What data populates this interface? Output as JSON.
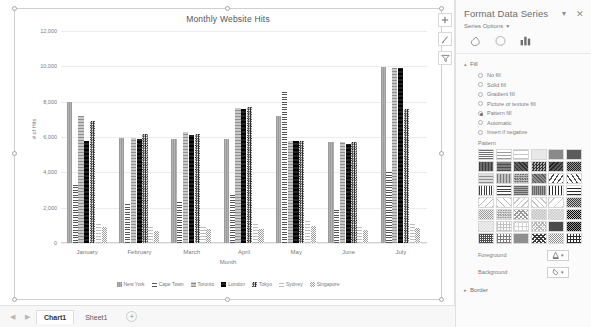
{
  "chart_data": {
    "type": "bar",
    "title": "Monthly Website Hits",
    "xlabel": "Month",
    "ylabel": "# of Hits",
    "ylim": [
      0,
      12000
    ],
    "yticks": [
      "0",
      "2,000",
      "4,000",
      "6,000",
      "8,000",
      "10,000",
      "12,000"
    ],
    "grid": true,
    "legend_position": "bottom",
    "categories": [
      "January",
      "February",
      "March",
      "April",
      "May",
      "June",
      "July"
    ],
    "series": [
      {
        "name": "New York",
        "values": [
          8000,
          5950,
          5900,
          5900,
          7200,
          5700,
          9950
        ]
      },
      {
        "name": "Cape Town",
        "values": [
          3400,
          2200,
          2400,
          2850,
          8600,
          2000,
          4100
        ]
      },
      {
        "name": "Toronto",
        "values": [
          7200,
          5950,
          6300,
          7650,
          5800,
          5700,
          9900
        ]
      },
      {
        "name": "London",
        "values": [
          5800,
          5900,
          6100,
          7600,
          5750,
          5600,
          9900
        ]
      },
      {
        "name": "Tokyo",
        "values": [
          6900,
          6150,
          6150,
          7700,
          5800,
          5700,
          7600
        ]
      },
      {
        "name": "Sydney",
        "values": [
          1200,
          900,
          1000,
          1050,
          1250,
          950,
          1100
        ]
      },
      {
        "name": "Singapore",
        "values": [
          900,
          700,
          800,
          820,
          980,
          760,
          860
        ]
      }
    ]
  },
  "chart_buttons": [
    {
      "name": "chart-elements",
      "glyph": "+"
    },
    {
      "name": "chart-styles",
      "glyph": "brush"
    },
    {
      "name": "chart-filters",
      "glyph": "funnel"
    }
  ],
  "tabbar": {
    "prev_label": "◀",
    "next_label": "▶",
    "tabs": [
      {
        "label": "Chart1",
        "active": true
      },
      {
        "label": "Sheet1",
        "active": false
      }
    ],
    "add_label": "+"
  },
  "pane": {
    "title": "Format Data Series",
    "subtitle": "Series Options",
    "subtitle_caret": "▼",
    "dropdown_glyph": "▾",
    "close_glyph": "✕",
    "tabs": [
      {
        "name": "fill-and-line-tab"
      },
      {
        "name": "effects-tab"
      },
      {
        "name": "series-options-tab"
      }
    ],
    "fill": {
      "section_label": "Fill",
      "expanded_caret": "▴",
      "options": [
        {
          "label": "No fill",
          "checked": false
        },
        {
          "label": "Solid fill",
          "checked": false
        },
        {
          "label": "Gradient fill",
          "checked": false
        },
        {
          "label": "Picture or texture fill",
          "checked": false
        },
        {
          "label": "Pattern fill",
          "checked": true
        },
        {
          "label": "Automatic",
          "checked": false
        },
        {
          "label": "Invert if negative",
          "checked": false
        }
      ],
      "pattern_label": "Pattern",
      "pattern_count": 48,
      "foreground_label": "Foreground",
      "background_label": "Background"
    },
    "border": {
      "section_label": "Border",
      "collapsed_caret": "▸"
    }
  }
}
